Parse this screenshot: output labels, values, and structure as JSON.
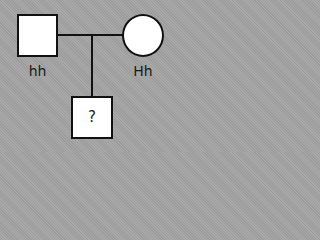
{
  "pedigree": {
    "father": {
      "symbol": "square",
      "genotype": "hh",
      "sex": "male"
    },
    "mother": {
      "symbol": "circle",
      "genotype": "Hh",
      "sex": "female"
    },
    "child": {
      "symbol": "square",
      "genotype": "?",
      "sex": "male"
    }
  },
  "colors": {
    "background": "#a4a4a4",
    "symbol_fill": "#ffffff",
    "line": "#111111",
    "text": "#1a1a1a"
  }
}
